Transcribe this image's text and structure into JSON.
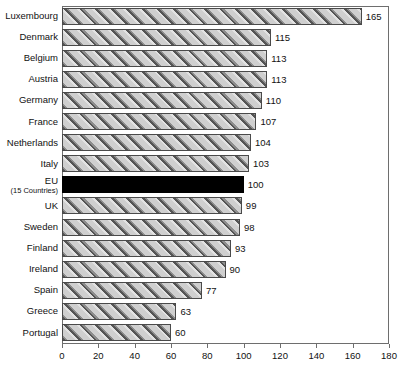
{
  "chart_data": {
    "type": "bar",
    "orientation": "horizontal",
    "title": "",
    "subtitle": "",
    "xlabel": "",
    "ylabel": "",
    "xlim": [
      0,
      180
    ],
    "xticks": [
      0,
      20,
      40,
      60,
      80,
      100,
      120,
      140,
      160,
      180
    ],
    "grid": false,
    "legend": null,
    "categories": [
      "Luxembourg",
      "Denmark",
      "Belgium",
      "Austria",
      "Germany",
      "France",
      "Netherlands",
      "Italy",
      "EU",
      "UK",
      "Sweden",
      "Finland",
      "Ireland",
      "Spain",
      "Greece",
      "Portugal"
    ],
    "category_sublabels": [
      "",
      "",
      "",
      "",
      "",
      "",
      "",
      "",
      "(15 Countries)",
      "",
      "",
      "",
      "",
      "",
      "",
      ""
    ],
    "values": [
      165,
      115,
      113,
      113,
      110,
      107,
      104,
      103,
      100,
      99,
      98,
      93,
      90,
      77,
      63,
      60
    ],
    "value_labels": [
      "165",
      "115",
      "113",
      "113",
      "110",
      "107",
      "104",
      "103",
      "100",
      "99",
      "98",
      "93",
      "90",
      "77",
      "63",
      "60"
    ],
    "highlight_index": 8,
    "colors": {
      "bar_fill": "#c9c9c9",
      "bar_hatch": "#555555",
      "bar_border": "#4a4a4a",
      "highlight_fill": "#000000",
      "frame": "#6e6e6e",
      "text": "#111111",
      "background": "#ffffff"
    }
  }
}
